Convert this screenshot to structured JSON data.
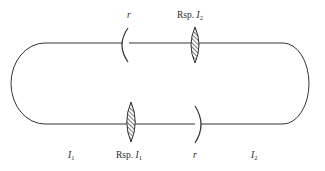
{
  "diagram": {
    "colors": {
      "line": "#333333",
      "text": "#2a2a2a",
      "background": "#ffffff",
      "hatch": "#333333"
    },
    "labels": {
      "top_mirror": {
        "text": "r"
      },
      "top_lens": {
        "prefix": "Rsp. ",
        "var": "I",
        "sub": "2"
      },
      "bottom_left_region": {
        "var": "I",
        "sub": "1"
      },
      "bottom_lens": {
        "prefix": "Rsp. ",
        "var": "I",
        "sub": "1"
      },
      "bottom_mirror": {
        "text": "r"
      },
      "bottom_right_region": {
        "var": "I",
        "sub": "2"
      }
    },
    "components": [
      {
        "id": "top-mirror",
        "type": "curved-mirror",
        "position": "top-left-center",
        "label": "r"
      },
      {
        "id": "top-lens",
        "type": "lens",
        "position": "top-right-center",
        "label": "Rsp. I2"
      },
      {
        "id": "bottom-lens",
        "type": "lens",
        "position": "bottom-left-center",
        "label": "Rsp. I1"
      },
      {
        "id": "bottom-mirror",
        "type": "curved-mirror",
        "position": "bottom-right-center",
        "label": "r"
      }
    ]
  }
}
